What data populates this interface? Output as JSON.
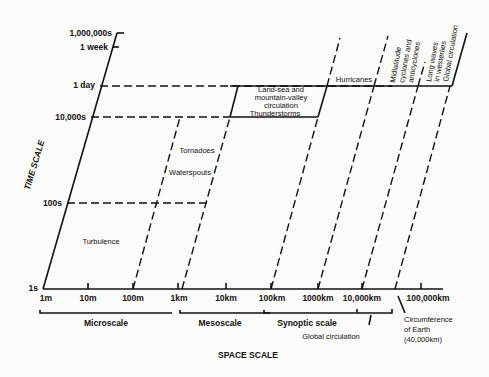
{
  "diagram": {
    "axes": {
      "y_title": "TIME SCALE",
      "x_title": "SPACE SCALE",
      "y_ticks": [
        "1,000,000s",
        "1 week",
        "1 day",
        "10,000s",
        "100s",
        "1s"
      ],
      "x_ticks": [
        "1m",
        "10m",
        "100m",
        "1km",
        "10km",
        "100km",
        "1000km",
        "10,000km",
        "100,000km"
      ]
    },
    "phenomena": {
      "turbulence": "Turbulence",
      "tornadoes": "Tornadoes",
      "waterspouts": "Waterspouts",
      "landsea_1": "Land-sea and",
      "landsea_2": "mountain-valley",
      "landsea_3": "circulation",
      "thunderstorms": "Thunderstorms",
      "hurricanes": "Hurricanes",
      "midlat_1": "Midlatitude",
      "midlat_2": "cyclones and",
      "midlat_3": "anticyclones",
      "longwaves_1": "Long waves",
      "longwaves_2": "in westerlies",
      "global": "Global circulation"
    },
    "scales": {
      "micro": "Microscale",
      "meso": "Mesoscale",
      "synoptic": "Synoptic scale",
      "global": "Global circulation"
    },
    "annotation": {
      "line1": "Circumference",
      "line2": "of Earth",
      "line3": "(40,000km)"
    }
  }
}
